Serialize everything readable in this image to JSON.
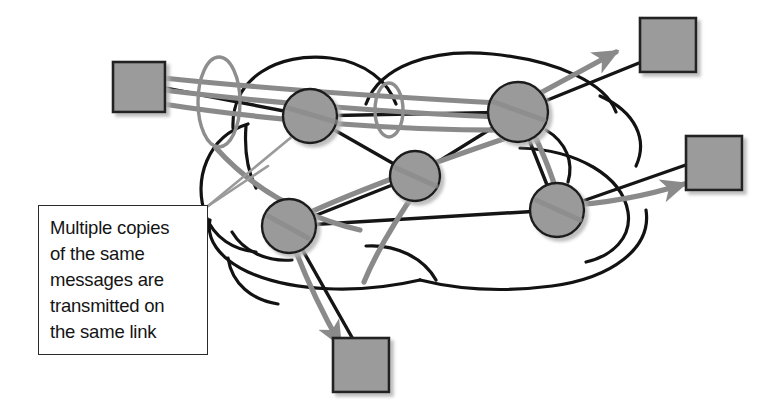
{
  "figure": {
    "type": "network-diagram",
    "background_color": "#ffffff"
  },
  "callout": {
    "text": "Multiple copies\nof the same\nmessages are\ntransmitted on\nthe same link",
    "border_color": "#2a2a2a",
    "text_color": "#141414",
    "background_color": "#ffffff"
  },
  "palette": {
    "node_fill": "#9a9a9a",
    "node_stroke": "#1f1f1f",
    "host_fill": "#9b9b9b",
    "host_stroke": "#242424",
    "link_stroke": "#151515",
    "flow_stroke": "#8a8a8a",
    "highlight_stroke": "#8e8e8e",
    "cloud_stroke": "#121212",
    "shadow": "#c9c9c9"
  },
  "cloud": {
    "label": "network-cloud",
    "stroke_width": 3.2
  },
  "routers": [
    {
      "name": "router-upper-left",
      "cx": 310,
      "cy": 116,
      "r": 27
    },
    {
      "name": "router-upper-right",
      "cx": 518,
      "cy": 112,
      "r": 30
    },
    {
      "name": "router-center",
      "cx": 415,
      "cy": 176,
      "r": 25
    },
    {
      "name": "router-lower-left",
      "cx": 289,
      "cy": 226,
      "r": 27
    },
    {
      "name": "router-lower-right",
      "cx": 557,
      "cy": 210,
      "r": 27
    }
  ],
  "hosts": [
    {
      "name": "host-source-left",
      "x": 113,
      "y": 62,
      "w": 52,
      "h": 50
    },
    {
      "name": "host-dest-top",
      "x": 640,
      "y": 18,
      "w": 56,
      "h": 54
    },
    {
      "name": "host-dest-right",
      "x": 686,
      "y": 136,
      "w": 56,
      "h": 54
    },
    {
      "name": "host-dest-bottom",
      "x": 333,
      "y": 338,
      "w": 56,
      "h": 54
    }
  ],
  "highlight_ellipses": [
    {
      "name": "highlight-ellipse-left",
      "cx": 219,
      "cy": 102,
      "rx": 21,
      "ry": 45
    },
    {
      "name": "highlight-ellipse-right",
      "cx": 389,
      "cy": 110,
      "rx": 14,
      "ry": 27
    }
  ],
  "flows": [
    {
      "name": "flow-to-top-host",
      "arrow": true
    },
    {
      "name": "flow-to-right-host",
      "arrow": true
    },
    {
      "name": "flow-to-bottom-host",
      "arrow": true
    }
  ],
  "leader_lines": [
    {
      "name": "leader-line-upper"
    },
    {
      "name": "leader-line-lower"
    }
  ]
}
